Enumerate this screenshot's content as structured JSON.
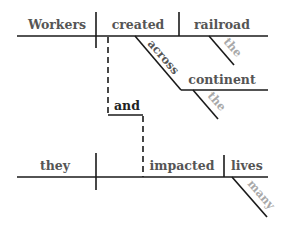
{
  "diagram": {
    "type": "Reed-Kellogg sentence diagram",
    "clause1": {
      "subject": "Workers",
      "verb": "created",
      "object": "railroad",
      "object_modifier": "the",
      "preposition": "across",
      "prep_object": "continent",
      "prep_object_modifier": "the"
    },
    "conjunction": "and",
    "clause2": {
      "subject": "they",
      "verb": "impacted",
      "object": "lives",
      "object_modifier": "many"
    },
    "colors": {
      "main_words": "#555555",
      "modifier_words": "#a8a8a8",
      "conjunction": "#222222",
      "lines": "#1a1a1a"
    }
  }
}
